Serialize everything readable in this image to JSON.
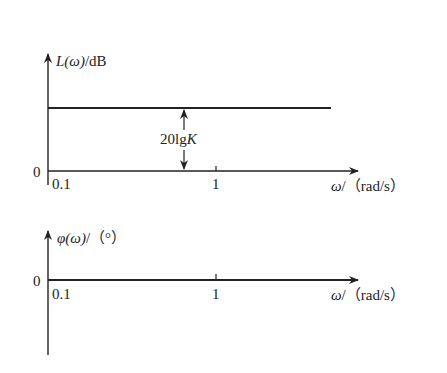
{
  "magnitude_plot": {
    "y_label_func": "L(ω)",
    "y_label_unit": "/dB",
    "zero_label": "0",
    "tick_01": "0.1",
    "tick_1": "1",
    "x_label_var": "ω",
    "x_label_unit": "/（rad/s）",
    "gain_annotation_prefix": "20lg",
    "gain_annotation_var": "K"
  },
  "phase_plot": {
    "y_label_func": "φ(ω)",
    "y_label_unit": "/（°）",
    "zero_label": "0",
    "tick_01": "0.1",
    "tick_1": "1",
    "x_label_var": "ω",
    "x_label_unit": "/（rad/s）"
  },
  "colors": {
    "line": "#222222"
  }
}
